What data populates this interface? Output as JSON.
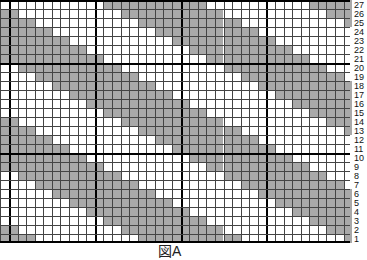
{
  "chart_data": {
    "type": "heatmap",
    "title": "",
    "rows": 27,
    "columns": 41,
    "row_labels": [
      "1",
      "2",
      "3",
      "4",
      "5",
      "6",
      "7",
      "8",
      "9",
      "10",
      "11",
      "12",
      "13",
      "14",
      "15",
      "16",
      "17",
      "18",
      "19",
      "20",
      "21",
      "22",
      "23",
      "24",
      "25",
      "26",
      "27"
    ],
    "pattern": "diagonal stripes: band width 12 cells, period 24 cells, shifts 2 columns right per row going down",
    "shaded_rule": "((col - 1 - 2*(21 - row)) mod 24) < 12",
    "major_grid_every": 10,
    "colors": {
      "shaded": "#a9a9a9",
      "empty": "#ffffff",
      "line": "#444444",
      "major_line": "#000000"
    }
  },
  "caption": "図A"
}
